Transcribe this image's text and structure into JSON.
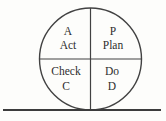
{
  "diagram": {
    "quadrants": {
      "top_left": {
        "line1": "A",
        "line2": "Act"
      },
      "top_right": {
        "line1": "P",
        "line2": "Plan"
      },
      "bottom_left": {
        "line1": "Check",
        "line2": "C"
      },
      "bottom_right": {
        "line1": "Do",
        "line2": "D"
      }
    },
    "colors": {
      "background": "#fdfdfb",
      "line": "#424242",
      "text": "#2e2e2e"
    }
  }
}
